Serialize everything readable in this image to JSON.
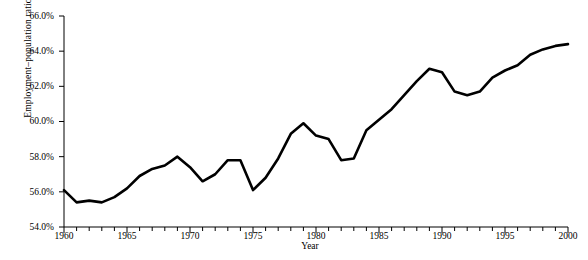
{
  "chart_data": {
    "type": "line",
    "title": "",
    "xlabel": "Year",
    "ylabel": "Employment–population ratio",
    "xlim": [
      1960,
      2000
    ],
    "ylim": [
      54.0,
      66.0
    ],
    "grid": false,
    "legend": "none",
    "x_ticks_major": [
      1960,
      1965,
      1970,
      1975,
      1980,
      1985,
      1990,
      1995,
      2000
    ],
    "x_tick_labels": [
      "1960",
      "1965",
      "1970",
      "1975",
      "1980",
      "1985",
      "1990",
      "1995",
      "2000"
    ],
    "x_tick_interval_minor": 1,
    "y_ticks": [
      54.0,
      56.0,
      58.0,
      60.0,
      62.0,
      64.0,
      66.0
    ],
    "y_tick_labels": [
      "54.0%",
      "56.0%",
      "58.0%",
      "60.0%",
      "62.0%",
      "64.0%",
      "66.0%"
    ],
    "line_color": "#000000",
    "line_width": 2.6,
    "series": [
      {
        "name": "Employment-population ratio",
        "x": [
          1960,
          1961,
          1962,
          1963,
          1964,
          1965,
          1966,
          1967,
          1968,
          1969,
          1970,
          1971,
          1972,
          1973,
          1974,
          1975,
          1976,
          1977,
          1978,
          1979,
          1980,
          1981,
          1982,
          1983,
          1984,
          1985,
          1986,
          1987,
          1988,
          1989,
          1990,
          1991,
          1992,
          1993,
          1994,
          1995,
          1996,
          1997,
          1998,
          1999,
          2000
        ],
        "values": [
          56.1,
          55.4,
          55.5,
          55.4,
          55.7,
          56.2,
          56.9,
          57.3,
          57.5,
          58.0,
          57.4,
          56.6,
          57.0,
          57.8,
          57.8,
          56.1,
          56.8,
          57.9,
          59.3,
          59.9,
          59.2,
          59.0,
          57.8,
          57.9,
          59.5,
          60.1,
          60.7,
          61.5,
          62.3,
          63.0,
          62.8,
          61.7,
          61.5,
          61.7,
          62.5,
          62.9,
          63.2,
          63.8,
          64.1,
          64.3,
          64.4
        ]
      }
    ]
  }
}
